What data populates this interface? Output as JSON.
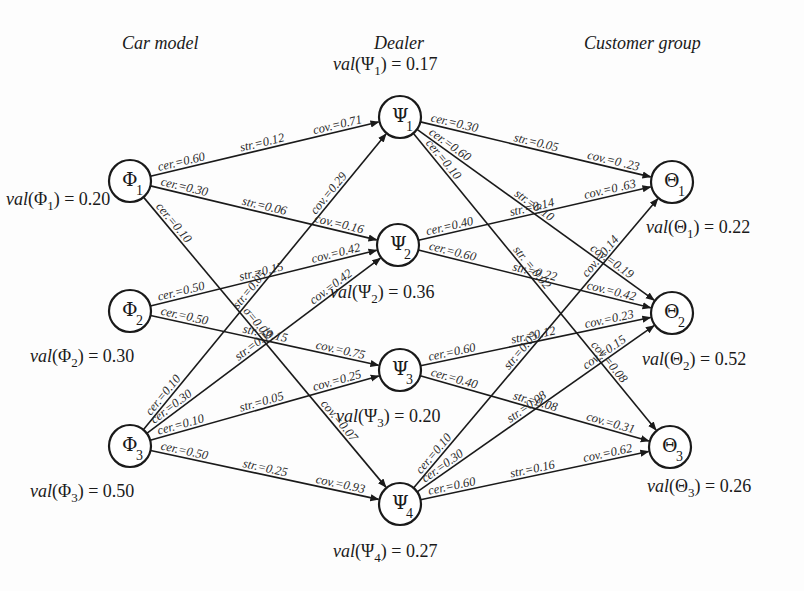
{
  "headers": {
    "car_model": "Car model",
    "dealer": "Dealer",
    "customer_group": "Customer group"
  },
  "nodes": [
    {
      "id": "phi1",
      "symbol": "Φ",
      "sub": "1",
      "layer": "car_model",
      "x": 130,
      "y": 181,
      "val_label": "val",
      "val": "0.20",
      "val_x": 6,
      "val_y": 205
    },
    {
      "id": "phi2",
      "symbol": "Φ",
      "sub": "2",
      "layer": "car_model",
      "x": 130,
      "y": 311,
      "val_label": "val",
      "val": "0.30",
      "val_x": 30,
      "val_y": 362
    },
    {
      "id": "phi3",
      "symbol": "Φ",
      "sub": "3",
      "layer": "car_model",
      "x": 130,
      "y": 446,
      "val_label": "val",
      "val": "0.50",
      "val_x": 30,
      "val_y": 497
    },
    {
      "id": "psi1",
      "symbol": "Ψ",
      "sub": "1",
      "layer": "dealer",
      "x": 400,
      "y": 117,
      "val_label": "val",
      "val": "0.17",
      "val_x": 333,
      "val_y": 70
    },
    {
      "id": "psi2",
      "symbol": "Ψ",
      "sub": "2",
      "layer": "dealer",
      "x": 398,
      "y": 245,
      "val_label": "val",
      "val": "0.36",
      "val_x": 330,
      "val_y": 298
    },
    {
      "id": "psi3",
      "symbol": "Ψ",
      "sub": "3",
      "layer": "dealer",
      "x": 400,
      "y": 370,
      "val_label": "val",
      "val": "0.20",
      "val_x": 336,
      "val_y": 422
    },
    {
      "id": "psi4",
      "symbol": "Ψ",
      "sub": "4",
      "layer": "dealer",
      "x": 400,
      "y": 504,
      "val_label": "val",
      "val": "0.27",
      "val_x": 333,
      "val_y": 557
    },
    {
      "id": "theta1",
      "symbol": "Θ",
      "sub": "1",
      "layer": "customer_group",
      "x": 672,
      "y": 182,
      "val_label": "val",
      "val": "0.22",
      "val_x": 646,
      "val_y": 233
    },
    {
      "id": "theta2",
      "symbol": "Θ",
      "sub": "2",
      "layer": "customer_group",
      "x": 672,
      "y": 313,
      "val_label": "val",
      "val": "0.52",
      "val_x": 642,
      "val_y": 365
    },
    {
      "id": "theta3",
      "symbol": "Θ",
      "sub": "3",
      "layer": "customer_group",
      "x": 670,
      "y": 447,
      "val_label": "val",
      "val": "0.26",
      "val_x": 647,
      "val_y": 492
    }
  ],
  "edges": [
    {
      "from": "phi1",
      "to": "psi1",
      "cer": "cer.=0.60",
      "str": "str.=0.12",
      "cov": "cov.=0.71"
    },
    {
      "from": "phi1",
      "to": "psi2",
      "cer": "cer.=0.30",
      "str": "str.=0.06",
      "cov": "cov.=0.16"
    },
    {
      "from": "phi1",
      "to": "psi4",
      "cer": "cer.=0.10",
      "str": "σ=0.02",
      "cov": "cov.=0.07"
    },
    {
      "from": "phi2",
      "to": "psi2",
      "cer": "cer.=0.50",
      "str": "str.=0.15",
      "cov": "cov.=0.42"
    },
    {
      "from": "phi2",
      "to": "psi3",
      "cer": "cer.=0.50",
      "str": "str.=0.15",
      "cov": "cov.=0.75"
    },
    {
      "from": "phi3",
      "to": "psi1",
      "cer": "cer.=0.10",
      "str": "str.=0.05",
      "cov": "cov.=0.29"
    },
    {
      "from": "phi3",
      "to": "psi2",
      "cer": "cer.=0.30",
      "str": "str.=0.15",
      "cov": "cov.=0.42"
    },
    {
      "from": "phi3",
      "to": "psi3",
      "cer": "cer.=0.10",
      "str": "str.=0.05",
      "cov": "cov.=0.25"
    },
    {
      "from": "phi3",
      "to": "psi4",
      "cer": "cer.=0.50",
      "str": "str.=0.25",
      "cov": "cov.=0.93"
    },
    {
      "from": "psi1",
      "to": "theta1",
      "cer": "cer.=0.30",
      "str": "str.=0.05",
      "cov": "cov.=0 .23"
    },
    {
      "from": "psi1",
      "to": "theta2",
      "cer": "cer.=0.60",
      "str": "str.=0.10",
      "cov": "cov.=0.19"
    },
    {
      "from": "psi1",
      "to": "theta3",
      "cer": "cer.=0.10",
      "str": "str. = 0.02",
      "cov": "cov.=0.08"
    },
    {
      "from": "psi2",
      "to": "theta1",
      "cer": "cer.=0.40",
      "str": "str.=0.14",
      "cov": "cov.=0 .63"
    },
    {
      "from": "psi2",
      "to": "theta2",
      "cer": "cer.=0.60",
      "str": "str.=0.22",
      "cov": "cov.=0.42"
    },
    {
      "from": "psi3",
      "to": "theta2",
      "cer": "cer.=0.60",
      "str": "str.=0.12",
      "cov": "cov.=0.23"
    },
    {
      "from": "psi3",
      "to": "theta3",
      "cer": "cer.=0.40",
      "str": "str.=0.08",
      "cov": "cov.=0.31"
    },
    {
      "from": "psi4",
      "to": "theta1",
      "cer": "cer.=0.10",
      "str": "str.=0.03",
      "cov": "cov.=0.14"
    },
    {
      "from": "psi4",
      "to": "theta2",
      "cer": "cer.=0.30",
      "str": "str.=0.08",
      "cov": "cov.=0.15"
    },
    {
      "from": "psi4",
      "to": "theta3",
      "cer": "cer.=0.60",
      "str": "str.=0.16",
      "cov": "cov.=0.62"
    }
  ],
  "style": {
    "line_color": "#1a1a1a",
    "background": "#fdfdfd",
    "node_radius": 21
  }
}
